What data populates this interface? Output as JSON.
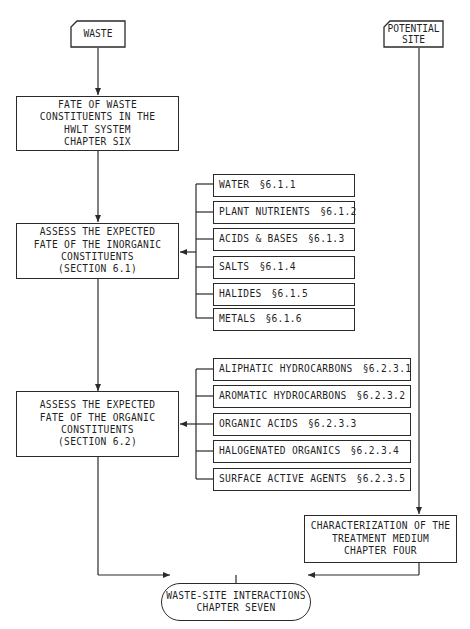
{
  "diagram": {
    "inputs": {
      "waste": "WASTE",
      "potential_site": [
        "POTENTIAL",
        "SITE"
      ]
    },
    "fate_box": [
      "FATE OF WASTE",
      "CONSTITUENTS IN THE",
      "HWLT SYSTEM",
      "CHAPTER SIX"
    ],
    "inorganic_box": [
      "ASSESS THE EXPECTED",
      "FATE OF THE INORGANIC",
      "CONSTITUENTS",
      "(SECTION 6.1)"
    ],
    "inorganic_items": [
      {
        "label": "WATER",
        "section": "§6.1.1"
      },
      {
        "label": "PLANT NUTRIENTS",
        "section": "§6.1.2"
      },
      {
        "label": "ACIDS & BASES",
        "section": "§6.1.3"
      },
      {
        "label": "SALTS",
        "section": "§6.1.4"
      },
      {
        "label": "HALIDES",
        "section": "§6.1.5"
      },
      {
        "label": "METALS",
        "section": "§6.1.6"
      }
    ],
    "organic_box": [
      "ASSESS THE EXPECTED",
      "FATE OF THE ORGANIC",
      "CONSTITUENTS",
      "(SECTION 6.2)"
    ],
    "organic_items": [
      {
        "label": "ALIPHATIC HYDROCARBONS",
        "section": "§6.2.3.1"
      },
      {
        "label": "AROMATIC HYDROCARBONS",
        "section": "§6.2.3.2"
      },
      {
        "label": "ORGANIC ACIDS",
        "section": "§6.2.3.3"
      },
      {
        "label": "HALOGENATED ORGANICS",
        "section": "§6.2.3.4"
      },
      {
        "label": "SURFACE ACTIVE AGENTS",
        "section": "§6.2.3.5"
      }
    ],
    "medium_box": [
      "CHARACTERIZATION OF THE",
      "TREATMENT MEDIUM",
      "CHAPTER FOUR"
    ],
    "output": [
      "WASTE-SITE INTERACTIONS",
      "CHAPTER SEVEN"
    ]
  }
}
